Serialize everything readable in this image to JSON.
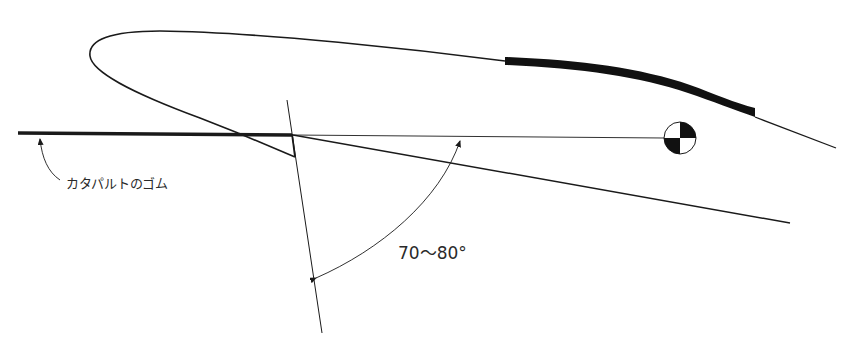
{
  "diagram": {
    "labels": {
      "rubber": "カタパルトのゴム",
      "angle": "70〜80°"
    },
    "colors": {
      "line": "#1a1a1a",
      "background": "#ffffff"
    },
    "elements": [
      "fuselage-outline",
      "wing-thick-band",
      "catapult-rubber-line",
      "launch-hook",
      "reference-horizontal-line",
      "center-of-gravity-symbol",
      "perpendicular-line",
      "angle-arc"
    ]
  }
}
